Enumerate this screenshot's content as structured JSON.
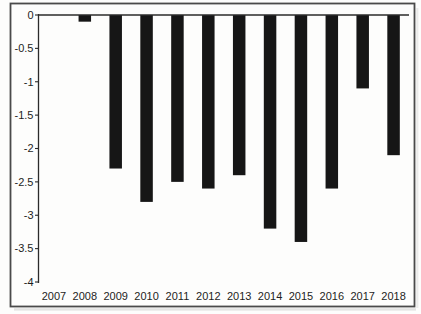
{
  "figure": {
    "background_color": "#fdfdfc",
    "frame_color": "#4a4a4a",
    "shadow_color": "rgba(0,0,0,0.10)"
  },
  "chart_data": {
    "type": "bar",
    "title": "",
    "xlabel": "",
    "ylabel": "",
    "categories": [
      "2007",
      "2008",
      "2009",
      "2010",
      "2011",
      "2012",
      "2013",
      "2014",
      "2015",
      "2016",
      "2017",
      "2018"
    ],
    "values": [
      0,
      -0.1,
      -2.3,
      -2.8,
      -2.5,
      -2.6,
      -2.4,
      -3.2,
      -3.4,
      -2.6,
      -1.1,
      -2.1
    ],
    "ylim": [
      -4,
      0
    ],
    "yticks": [
      0,
      -0.5,
      -1,
      -1.5,
      -2,
      -2.5,
      -3,
      -3.5,
      -4
    ],
    "ytick_labels": [
      "0",
      "-0.5",
      "-1",
      "-1.5",
      "-2",
      "-2.5",
      "-3",
      "-3.5",
      "-4"
    ],
    "baseline": 0,
    "grid": false,
    "legend": false,
    "orientation": "vertical",
    "bar_color": "#161616",
    "axis_color": "#2b2b2b",
    "text_color": "#1d1d1d"
  }
}
